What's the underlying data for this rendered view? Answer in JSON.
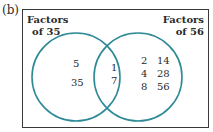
{
  "figure_label": "(b)",
  "venn": {
    "left_set": {
      "title_line1": "Factors",
      "title_line2": "of 35",
      "only": [
        "5",
        "35"
      ]
    },
    "right_set": {
      "title_line1": "Factors",
      "title_line2": "of 56",
      "only_col1": [
        "2",
        "4",
        "8"
      ],
      "only_col2": [
        "14",
        "28",
        "56"
      ]
    },
    "intersection": [
      "1",
      "7"
    ],
    "circle_color": "#2e8a96"
  }
}
